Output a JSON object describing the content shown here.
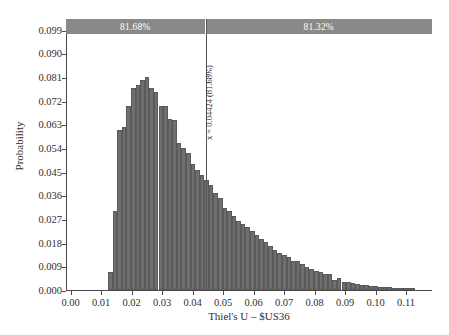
{
  "chart_data": {
    "type": "bar",
    "title": "",
    "subtitle": "",
    "xlabel": "Thiel's U – $US36",
    "ylabel": "Probability",
    "xlim": [
      -0.0015,
      0.1185
    ],
    "ylim": [
      0.0,
      0.1035
    ],
    "grid": false,
    "legend_position": "none",
    "x_ticks": [
      "0.00",
      "0.01",
      "0.02",
      "0.03",
      "0.04",
      "0.05",
      "0.06",
      "0.07",
      "0.08",
      "0.09",
      "0.10",
      "0.11"
    ],
    "x_tick_values": [
      0.0,
      0.01,
      0.02,
      0.03,
      0.04,
      0.05,
      0.06,
      0.07,
      0.08,
      0.09,
      0.1,
      0.11
    ],
    "y_ticks": [
      "0.000",
      "0.009",
      "0.018",
      "0.027",
      "0.036",
      "0.045",
      "0.054",
      "0.063",
      "0.072",
      "0.081",
      "0.090",
      "0.099"
    ],
    "y_tick_values": [
      0.0,
      0.009,
      0.018,
      0.027,
      0.036,
      0.045,
      0.054,
      0.063,
      0.072,
      0.081,
      0.09,
      0.099
    ],
    "bin_width": 0.0015,
    "bin_left_edges": [
      0.012,
      0.0135,
      0.015,
      0.0165,
      0.018,
      0.0195,
      0.021,
      0.0225,
      0.024,
      0.0255,
      0.027,
      0.0285,
      0.03,
      0.0315,
      0.033,
      0.0345,
      0.036,
      0.0375,
      0.039,
      0.0405,
      0.042,
      0.0435,
      0.045,
      0.0465,
      0.048,
      0.0495,
      0.051,
      0.0525,
      0.054,
      0.0555,
      0.057,
      0.0585,
      0.06,
      0.0615,
      0.063,
      0.0645,
      0.066,
      0.0675,
      0.069,
      0.0705,
      0.072,
      0.0735,
      0.075,
      0.0765,
      0.078,
      0.0795,
      0.081,
      0.0825,
      0.084,
      0.0855,
      0.087,
      0.0885,
      0.09,
      0.0915,
      0.093,
      0.0945,
      0.096,
      0.0975,
      0.099,
      0.1005,
      0.102,
      0.1035,
      0.105,
      0.1065,
      0.108,
      0.1095,
      0.111
    ],
    "values": [
      0.007,
      0.03,
      0.0608,
      0.062,
      0.07,
      0.077,
      0.0782,
      0.08,
      0.0812,
      0.077,
      0.0755,
      0.0702,
      0.07,
      0.065,
      0.0648,
      0.056,
      0.054,
      0.052,
      0.048,
      0.0458,
      0.0438,
      0.0418,
      0.0398,
      0.0368,
      0.035,
      0.0312,
      0.03,
      0.028,
      0.0262,
      0.025,
      0.024,
      0.0225,
      0.0208,
      0.0195,
      0.0182,
      0.0168,
      0.0152,
      0.014,
      0.0132,
      0.0125,
      0.0112,
      0.0112,
      0.0098,
      0.0086,
      0.008,
      0.0072,
      0.0068,
      0.0062,
      0.006,
      0.004,
      0.0045,
      0.0032,
      0.003,
      0.0026,
      0.0024,
      0.002,
      0.0019,
      0.0016,
      0.0014,
      0.0013,
      0.0012,
      0.001,
      0.0009,
      0.0008,
      0.0007,
      0.0006,
      0.0005
    ],
    "bars_color": "#716f6d",
    "bars_edge_color": "#5c5a58"
  },
  "certainty_band": {
    "color": "#8b8987",
    "text_color": "#ffffff",
    "segments": [
      {
        "label": "81.68%",
        "split_value": 0.04424
      },
      {
        "label": "81.32%",
        "split_value": null
      }
    ]
  },
  "marker": {
    "label": "x = 0.04424 (81.68%)",
    "value": 0.04424,
    "color": "#555353"
  },
  "axes": {
    "line_color": "#4a4a4a",
    "text_color": "#2f2f2f"
  }
}
